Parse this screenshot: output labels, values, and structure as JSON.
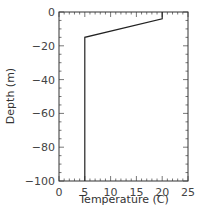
{
  "chart_data": {
    "type": "line",
    "title": "",
    "xlabel": "Temperature (C)",
    "ylabel": "Depth (m)",
    "xlim": [
      0,
      25
    ],
    "ylim": [
      -100,
      0
    ],
    "xticks": [
      0,
      5,
      10,
      15,
      20,
      25
    ],
    "yticks": [
      0,
      -20,
      -40,
      -60,
      -80,
      -100
    ],
    "xtick_labels": [
      "0",
      "5",
      "10",
      "15",
      "20",
      "25"
    ],
    "ytick_labels": [
      "0",
      "−20",
      "−40",
      "−60",
      "−80",
      "−100"
    ],
    "grid": false,
    "legend": null,
    "series": [
      {
        "name": "temperature-profile",
        "x": [
          20,
          20,
          5,
          5
        ],
        "y": [
          0,
          -4,
          -15,
          -100
        ],
        "color": "#222222"
      }
    ]
  }
}
